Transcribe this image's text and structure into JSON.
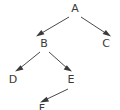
{
  "diagram": {
    "type": "directed-tree-graph",
    "canvas": {
      "width": 120,
      "height": 110,
      "background": "#ffffff"
    },
    "style": {
      "edge_color": "#4a4a4a",
      "arrow_color": "#3a3a3a",
      "label_color": "#3a3a3a",
      "edge_width": 1,
      "label_font_size": 11
    },
    "nodes": [
      {
        "id": "A",
        "label": "A",
        "x": 75,
        "y": 12,
        "clipped": false
      },
      {
        "id": "B",
        "label": "B",
        "x": 44,
        "y": 47,
        "clipped": false
      },
      {
        "id": "C",
        "label": "C",
        "x": 106,
        "y": 47,
        "clipped": false
      },
      {
        "id": "D",
        "label": "D",
        "x": 13,
        "y": 83,
        "clipped": false
      },
      {
        "id": "E",
        "label": "E",
        "x": 71,
        "y": 83,
        "clipped": false
      },
      {
        "id": "F",
        "label": "F",
        "x": 42,
        "y": 112,
        "clipped": true
      }
    ],
    "edges": [
      {
        "id": "A-B",
        "from": "A",
        "to": "B",
        "x1": 69,
        "y1": 17,
        "x2": 38,
        "y2": 36,
        "arrow": true,
        "direction": "down-left"
      },
      {
        "id": "A-C",
        "from": "A",
        "to": "C",
        "x1": 81,
        "y1": 17,
        "x2": 109,
        "y2": 36,
        "arrow": true,
        "direction": "down-right"
      },
      {
        "id": "B-D",
        "from": "B",
        "to": "D",
        "x1": 40,
        "y1": 52,
        "x2": 17,
        "y2": 71,
        "arrow": true,
        "direction": "down-left"
      },
      {
        "id": "B-E",
        "from": "B",
        "to": "E",
        "x1": 49,
        "y1": 52,
        "x2": 70,
        "y2": 71,
        "arrow": true,
        "direction": "down-right"
      },
      {
        "id": "E-F",
        "from": "E",
        "to": "F",
        "x1": 68,
        "y1": 89,
        "x2": 42,
        "y2": 102,
        "arrow": true,
        "direction": "down-left"
      }
    ]
  }
}
